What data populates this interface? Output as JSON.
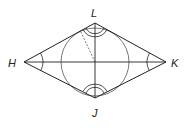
{
  "diagram": {
    "type": "geometry",
    "colors": {
      "stroke": "#222222",
      "circle": "#555555",
      "background": "#ffffff"
    },
    "vertices": {
      "L": {
        "label": "L",
        "x": 95,
        "y": 23
      },
      "K": {
        "label": "K",
        "x": 166,
        "y": 62
      },
      "J": {
        "label": "J",
        "x": 95,
        "y": 98
      },
      "H": {
        "label": "H",
        "x": 24,
        "y": 62
      }
    },
    "labels": {
      "L": "L",
      "K": "K",
      "J": "J",
      "H": "H"
    }
  }
}
